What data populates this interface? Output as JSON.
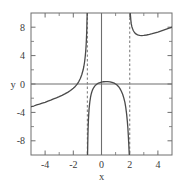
{
  "figure": {
    "background_color": "#ffffff",
    "frame_color": "#6e6e6e",
    "curve_color": "#4a4a4a",
    "asymptote_color": "#8a8a8a",
    "axis_color": "#6e6e6e",
    "label_color": "#3b3b3b"
  },
  "chart_data": {
    "type": "line",
    "title": "",
    "subtitle": "",
    "xlabel": "x",
    "ylabel": "y",
    "xlim": [
      -5,
      5
    ],
    "ylim": [
      -10,
      10
    ],
    "grid": false,
    "legend": null,
    "xticks": [
      -4,
      -2,
      0,
      2,
      4
    ],
    "xtick_labels": [
      "-4",
      "-2",
      "0",
      "2",
      "4"
    ],
    "yticks": [
      -8,
      -4,
      0,
      4,
      8
    ],
    "ytick_labels": [
      "-8",
      "-4",
      "0",
      "4",
      "8"
    ],
    "xminor_ticks": [
      -5,
      -3,
      -1,
      1,
      3,
      5
    ],
    "yminor_ticks": [
      -10,
      -6,
      -2,
      2,
      6,
      10
    ],
    "annotations": [
      {
        "text": "x",
        "role": "x-axis-title",
        "x": 0,
        "y": -12.3
      },
      {
        "text": "y",
        "role": "y-axis-title",
        "x": -6.1,
        "y": 0
      }
    ],
    "vertical_asymptotes": [
      -1,
      2
    ],
    "asymptote_style": "dashed",
    "series": [
      {
        "name": "branch-left",
        "domain": [
          -5,
          -1
        ],
        "points": [
          [
            -5.0,
            -3.2
          ],
          [
            -4.8,
            -3.1
          ],
          [
            -4.6,
            -2.95
          ],
          [
            -4.4,
            -2.85
          ],
          [
            -4.2,
            -2.7
          ],
          [
            -4.0,
            -2.58
          ],
          [
            -3.8,
            -2.42
          ],
          [
            -3.6,
            -2.28
          ],
          [
            -3.4,
            -2.1
          ],
          [
            -3.2,
            -1.95
          ],
          [
            -3.0,
            -1.78
          ],
          [
            -2.8,
            -1.6
          ],
          [
            -2.6,
            -1.4
          ],
          [
            -2.4,
            -1.18
          ],
          [
            -2.2,
            -0.92
          ],
          [
            -2.0,
            -0.6
          ],
          [
            -1.9,
            -0.42
          ],
          [
            -1.8,
            -0.2
          ],
          [
            -1.7,
            0.05
          ],
          [
            -1.6,
            0.38
          ],
          [
            -1.5,
            0.78
          ],
          [
            -1.4,
            1.3
          ],
          [
            -1.3,
            2.0
          ],
          [
            -1.25,
            2.5
          ],
          [
            -1.2,
            3.1
          ],
          [
            -1.15,
            3.95
          ],
          [
            -1.12,
            4.6
          ],
          [
            -1.09,
            5.5
          ],
          [
            -1.07,
            6.3
          ],
          [
            -1.05,
            7.3
          ],
          [
            -1.04,
            8.0
          ],
          [
            -1.03,
            8.9
          ],
          [
            -1.02,
            9.5
          ],
          [
            -1.015,
            9.9
          ],
          [
            -1.01,
            10.0
          ]
        ]
      },
      {
        "name": "branch-middle",
        "domain": [
          -1,
          2
        ],
        "points": [
          [
            -0.99,
            -10.0
          ],
          [
            -0.985,
            -9.5
          ],
          [
            -0.98,
            -9.0
          ],
          [
            -0.975,
            -8.4
          ],
          [
            -0.97,
            -7.9
          ],
          [
            -0.96,
            -7.0
          ],
          [
            -0.95,
            -6.3
          ],
          [
            -0.94,
            -5.7
          ],
          [
            -0.93,
            -5.2
          ],
          [
            -0.92,
            -4.8
          ],
          [
            -0.9,
            -4.1
          ],
          [
            -0.88,
            -3.5
          ],
          [
            -0.85,
            -2.9
          ],
          [
            -0.82,
            -2.4
          ],
          [
            -0.78,
            -1.9
          ],
          [
            -0.74,
            -1.5
          ],
          [
            -0.7,
            -1.2
          ],
          [
            -0.65,
            -0.9
          ],
          [
            -0.6,
            -0.68
          ],
          [
            -0.55,
            -0.5
          ],
          [
            -0.48,
            -0.3
          ],
          [
            -0.4,
            -0.13
          ],
          [
            -0.32,
            0.0
          ],
          [
            -0.22,
            0.12
          ],
          [
            -0.1,
            0.2
          ],
          [
            0.0,
            0.26
          ],
          [
            0.15,
            0.32
          ],
          [
            0.3,
            0.34
          ],
          [
            0.45,
            0.33
          ],
          [
            0.6,
            0.3
          ],
          [
            0.75,
            0.23
          ],
          [
            0.9,
            0.12
          ],
          [
            1.0,
            0.0
          ],
          [
            1.1,
            -0.15
          ],
          [
            1.2,
            -0.35
          ],
          [
            1.3,
            -0.62
          ],
          [
            1.4,
            -0.98
          ],
          [
            1.5,
            -1.45
          ],
          [
            1.58,
            -1.95
          ],
          [
            1.66,
            -2.6
          ],
          [
            1.72,
            -3.3
          ],
          [
            1.78,
            -4.2
          ],
          [
            1.83,
            -5.2
          ],
          [
            1.87,
            -6.2
          ],
          [
            1.9,
            -7.2
          ],
          [
            1.93,
            -8.3
          ],
          [
            1.95,
            -9.2
          ],
          [
            1.965,
            -9.8
          ],
          [
            1.975,
            -10.0
          ]
        ]
      },
      {
        "name": "branch-right",
        "domain": [
          2,
          5
        ],
        "points": [
          [
            2.04,
            10.0
          ],
          [
            2.06,
            9.5
          ],
          [
            2.08,
            9.0
          ],
          [
            2.11,
            8.5
          ],
          [
            2.15,
            8.1
          ],
          [
            2.2,
            7.8
          ],
          [
            2.26,
            7.5
          ],
          [
            2.34,
            7.25
          ],
          [
            2.44,
            7.05
          ],
          [
            2.56,
            6.92
          ],
          [
            2.7,
            6.85
          ],
          [
            2.85,
            6.82
          ],
          [
            3.0,
            6.84
          ],
          [
            3.2,
            6.9
          ],
          [
            3.4,
            6.98
          ],
          [
            3.6,
            7.08
          ],
          [
            3.8,
            7.2
          ],
          [
            4.0,
            7.32
          ],
          [
            4.2,
            7.45
          ],
          [
            4.4,
            7.58
          ],
          [
            4.6,
            7.72
          ],
          [
            4.8,
            7.86
          ],
          [
            5.0,
            8.0
          ]
        ]
      }
    ]
  }
}
